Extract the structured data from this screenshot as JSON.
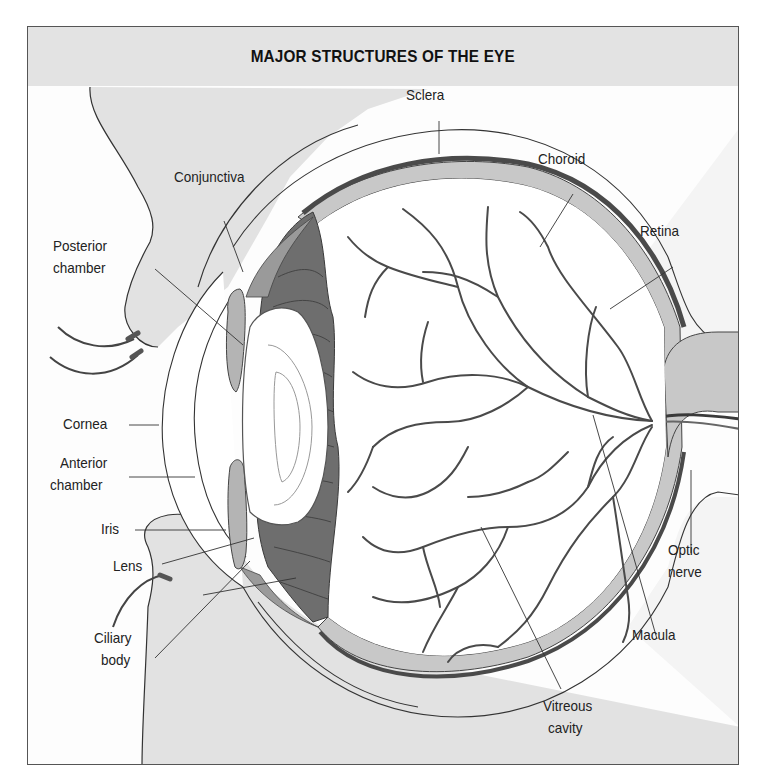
{
  "diagram": {
    "title": "MAJOR STRUCTURES OF THE EYE",
    "type": "anatomical cross-section",
    "colors": {
      "title_band": "#e3e3e3",
      "face_skin": "#e2e2e2",
      "retina_choroid_band": "#c8c8c8",
      "choroid_dark": "#555555",
      "ciliary_body": "#6e6e6e",
      "iris": "#b4b4b4",
      "vessel": "#4a4a4a",
      "outline": "#333333"
    },
    "labels": {
      "sclera": "Sclera",
      "choroid": "Choroid",
      "conjunctiva": "Conjunctiva",
      "retina": "Retina",
      "posterior_chamber_1": "Posterior",
      "posterior_chamber_2": "chamber",
      "cornea": "Cornea",
      "anterior_chamber_1": "Anterior",
      "anterior_chamber_2": "chamber",
      "iris": "Iris",
      "lens": "Lens",
      "optic_nerve_1": "Optic",
      "optic_nerve_2": "nerve",
      "ciliary_body_1": "Ciliary",
      "ciliary_body_2": "body",
      "macula": "Macula",
      "vitreous_cavity_1": "Vitreous",
      "vitreous_cavity_2": "cavity"
    }
  }
}
